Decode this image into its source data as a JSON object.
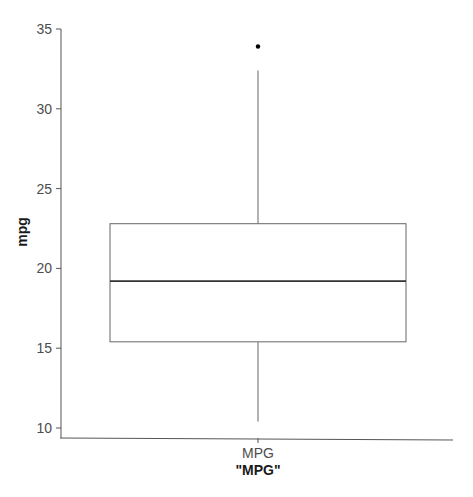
{
  "chart_data": {
    "type": "box",
    "title": "",
    "xlabel": "\"MPG\"",
    "ylabel": "mpg",
    "categories": [
      "MPG"
    ],
    "boxes": [
      {
        "name": "MPG",
        "whisker_low": 10.4,
        "q1": 15.4,
        "median": 19.2,
        "q3": 22.8,
        "whisker_high": 32.4,
        "outliers": [
          33.9
        ]
      }
    ],
    "ylim": [
      10,
      35
    ],
    "yticks": [
      10,
      15,
      20,
      25,
      30,
      35
    ],
    "grid": false,
    "legend": "none"
  },
  "axes": {
    "y_ticks": [
      "10",
      "15",
      "20",
      "25",
      "30",
      "35"
    ],
    "x_tick": "MPG",
    "x_title": "\"MPG\"",
    "y_title": "mpg"
  },
  "colors": {
    "axis": "#555555",
    "box_stroke": "#666666",
    "median": "#333333",
    "outlier": "#000000"
  }
}
